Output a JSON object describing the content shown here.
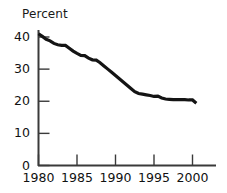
{
  "chart_data": {
    "type": "line",
    "title": "Percent",
    "xlabel": "",
    "ylabel": "",
    "xlim": [
      1980,
      2001
    ],
    "ylim": [
      0,
      43
    ],
    "grid": false,
    "legend": null,
    "y_ticks": [
      0,
      10,
      20,
      30,
      40
    ],
    "y_tick_labels": [
      "0",
      "10",
      "20",
      "30",
      "40"
    ],
    "x_ticks": [
      1980,
      1985,
      1990,
      1995,
      2000
    ],
    "x_tick_labels": [
      "1980",
      "1985",
      "1990",
      "1995",
      "2000"
    ],
    "series": [
      {
        "name": "Percent",
        "color": "#141414",
        "x": [
          1980,
          1980.5,
          1981,
          1981.5,
          1982,
          1982.5,
          1983,
          1983.5,
          1984,
          1984.5,
          1985,
          1985.5,
          1986,
          1986.5,
          1987,
          1987.5,
          1988,
          1988.5,
          1989,
          1989.5,
          1990,
          1990.5,
          1991,
          1991.5,
          1992,
          1992.5,
          1993,
          1993.5,
          1994,
          1994.5,
          1995,
          1995.5,
          1996,
          1996.5,
          1997,
          1997.5,
          1998,
          1998.5,
          1999,
          1999.5,
          2000,
          2000.5
        ],
        "values": [
          41.0,
          40.2,
          39.3,
          38.8,
          38.0,
          37.6,
          37.4,
          37.4,
          36.5,
          35.6,
          34.9,
          34.3,
          34.2,
          33.4,
          32.9,
          32.8,
          32.0,
          31.0,
          30.0,
          29.0,
          28.0,
          27.0,
          26.0,
          25.0,
          24.0,
          23.0,
          22.4,
          22.2,
          22.0,
          21.8,
          21.5,
          21.6,
          21.0,
          20.7,
          20.6,
          20.5,
          20.5,
          20.5,
          20.5,
          20.4,
          20.4,
          19.4
        ]
      }
    ]
  },
  "axes": {
    "title_text": "Percent"
  }
}
